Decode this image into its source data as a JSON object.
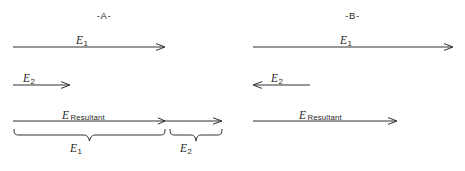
{
  "figure": {
    "background_color": "#ffffff",
    "line_color": "#1a1a1a"
  },
  "panels": [
    {
      "id": "A",
      "title": "-A-",
      "vectors": [
        {
          "name": "E1",
          "label_symbol": "E",
          "label_subscript": "1",
          "direction": "right",
          "x_start": 13,
          "x_end": 165,
          "y": 50,
          "arrowheads": 1
        },
        {
          "name": "E2",
          "label_symbol": "E",
          "label_subscript": "2",
          "direction": "right",
          "x_start": 13,
          "x_end": 70,
          "y": 88,
          "arrowheads": 1
        },
        {
          "name": "E_Resultant",
          "label_symbol": "E",
          "label_subscript": "Resultant",
          "direction": "right",
          "x_start": 13,
          "x_end": 222,
          "y": 124,
          "arrowheads": 2,
          "mid_arrowhead_x": 165
        }
      ],
      "braces": [
        {
          "name": "brace-E1",
          "label_symbol": "E",
          "label_subscript": "1",
          "x_start": 13,
          "x_end": 165
        },
        {
          "name": "brace-E2",
          "label_symbol": "E",
          "label_subscript": "2",
          "x_start": 169,
          "x_end": 222
        }
      ]
    },
    {
      "id": "B",
      "title": "-B-",
      "vectors": [
        {
          "name": "E1",
          "label_symbol": "E",
          "label_subscript": "1",
          "direction": "right",
          "x_start": 21,
          "x_end": 221,
          "y": 50,
          "arrowheads": 1
        },
        {
          "name": "E2",
          "label_symbol": "E",
          "label_subscript": "2",
          "direction": "left",
          "x_start": 21,
          "x_end": 78,
          "y": 88,
          "arrowheads": 1
        },
        {
          "name": "E_Resultant",
          "label_symbol": "E",
          "label_subscript": "Resultant",
          "direction": "right",
          "x_start": 21,
          "x_end": 165,
          "y": 124,
          "arrowheads": 1
        }
      ],
      "braces": []
    }
  ]
}
